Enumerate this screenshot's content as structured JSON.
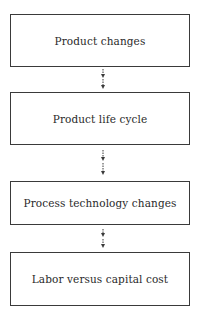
{
  "diagram": {
    "type": "vertical-flowchart",
    "nodes": [
      {
        "id": "n1",
        "label": "Product changes"
      },
      {
        "id": "n2",
        "label": "Product life cycle"
      },
      {
        "id": "n3",
        "label": "Process technology changes"
      },
      {
        "id": "n4",
        "label": "Labor versus capital cost"
      }
    ],
    "edges": [
      {
        "from": "n1",
        "to": "n2",
        "style": "dashed-arrow"
      },
      {
        "from": "n2",
        "to": "n3",
        "style": "dashed-arrow"
      },
      {
        "from": "n3",
        "to": "n4",
        "style": "dashed-arrow"
      }
    ],
    "colors": {
      "border": "#3a3a3a",
      "text": "#2a2a2a",
      "background": "#ffffff"
    }
  }
}
